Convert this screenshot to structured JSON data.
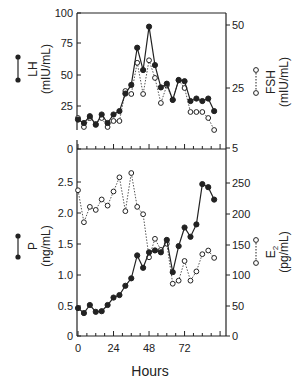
{
  "chart_data": [
    {
      "type": "line",
      "panel": "upper",
      "x": [
        0,
        4,
        8,
        12,
        16,
        20,
        24,
        28,
        32,
        36,
        40,
        44,
        48,
        52,
        56,
        60,
        64,
        68,
        72,
        76,
        80,
        84,
        88,
        92
      ],
      "series": [
        {
          "name": "LH",
          "axis": "left",
          "marker": "filled-circle",
          "line": "solid",
          "values": [
            17,
            15,
            19,
            14,
            20,
            15,
            20,
            22,
            35,
            42,
            72,
            54,
            89,
            58,
            40,
            43,
            30,
            46,
            45,
            29,
            31,
            29,
            31,
            22
          ]
        },
        {
          "name": "FSH",
          "axis": "right",
          "marker": "open-circle",
          "line": "dotted",
          "values": [
            15,
            12,
            15,
            13,
            15,
            12,
            14,
            14,
            24,
            23,
            35,
            23,
            36,
            29,
            20,
            26,
            21,
            28,
            25,
            17,
            17,
            17,
            15,
            11
          ]
        }
      ],
      "left_axis": {
        "label": "LH",
        "unit": "(mIU/mL)",
        "ticks": [
          "100",
          "75",
          "50",
          "25",
          "0"
        ]
      },
      "right_axis": {
        "label": "FSH",
        "unit": "(mIU/mL)",
        "ticks": [
          "50",
          "25",
          "5"
        ]
      }
    },
    {
      "type": "line",
      "panel": "lower",
      "x": [
        0,
        4,
        8,
        12,
        16,
        20,
        24,
        28,
        32,
        36,
        40,
        44,
        48,
        52,
        56,
        60,
        64,
        68,
        72,
        76,
        80,
        84,
        88,
        92
      ],
      "series": [
        {
          "name": "P",
          "axis": "left",
          "marker": "filled-circle",
          "line": "solid",
          "values": [
            0.45,
            0.37,
            0.5,
            0.39,
            0.4,
            0.5,
            0.62,
            0.66,
            0.81,
            0.93,
            1.3,
            1.1,
            1.35,
            1.38,
            1.35,
            1.55,
            1.03,
            1.45,
            1.75,
            1.6,
            1.8,
            2.45,
            2.4,
            2.2
          ]
        },
        {
          "name": "E2",
          "axis": "right",
          "marker": "open-circle",
          "line": "dotted",
          "values": [
            237,
            185,
            210,
            205,
            222,
            212,
            235,
            258,
            203,
            265,
            210,
            198,
            128,
            158,
            140,
            150,
            85,
            90,
            122,
            90,
            105,
            133,
            139,
            127
          ]
        }
      ],
      "left_axis": {
        "label": "P",
        "unit": "(ng/mL)",
        "ticks": [
          "2.5",
          "2.0",
          "1.5",
          "1.0",
          "0.5",
          "0"
        ],
        "ylim": [
          0,
          2.75
        ]
      },
      "right_axis": {
        "label": "E2",
        "unit": "(pg/mL)",
        "ticks": [
          "250",
          "200",
          "150",
          "100",
          "50",
          "0"
        ],
        "ylim": [
          0,
          275
        ]
      }
    }
  ],
  "x_axis": {
    "label": "Hours",
    "ticks": [
      "0",
      "24",
      "48",
      "72"
    ]
  },
  "panels": {
    "upper": {
      "left_ticks": [
        {
          "v": "100",
          "y": 13
        },
        {
          "v": "75",
          "y": 43
        },
        {
          "v": "50",
          "y": 75
        },
        {
          "v": "25",
          "y": 106
        },
        {
          "v": "0",
          "y": 149
        }
      ],
      "right_ticks": [
        {
          "v": "50",
          "y": 25
        },
        {
          "v": "25",
          "y": 88
        },
        {
          "v": "5",
          "y": 148
        }
      ],
      "left_title": "LH",
      "left_unit": "(mIU/mL)",
      "right_title": "FSH",
      "right_unit": "(mIU/mL)"
    },
    "lower": {
      "left_ticks": [
        {
          "v": "2.5",
          "y": 182
        },
        {
          "v": "2.0",
          "y": 213
        },
        {
          "v": "1.5",
          "y": 244
        },
        {
          "v": "1.0",
          "y": 275
        },
        {
          "v": "0.5",
          "y": 306
        },
        {
          "v": "0",
          "y": 336
        }
      ],
      "right_ticks": [
        {
          "v": "250",
          "y": 183
        },
        {
          "v": "200",
          "y": 214
        },
        {
          "v": "150",
          "y": 245
        },
        {
          "v": "100",
          "y": 275
        },
        {
          "v": "50",
          "y": 306
        },
        {
          "v": "0",
          "y": 336
        }
      ],
      "left_title": "P",
      "left_unit": "(ng/mL)",
      "right_title": "E",
      "right_sub": "2",
      "right_unit": "(pg/mL)"
    }
  }
}
